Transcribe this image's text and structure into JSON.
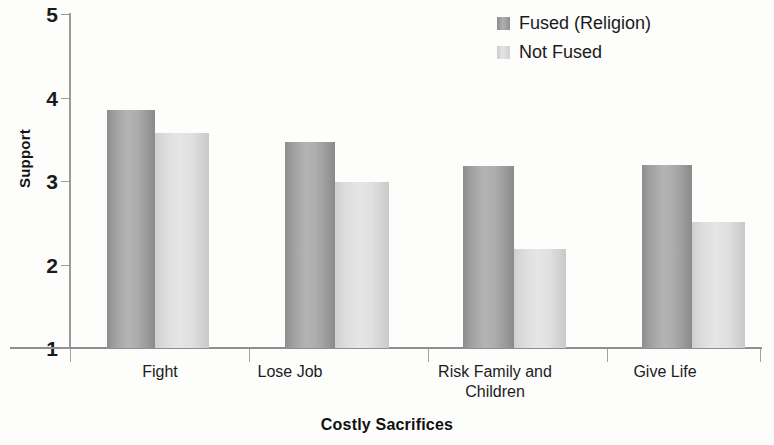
{
  "chart_data": {
    "type": "bar",
    "title": "",
    "xlabel": "Costly Sacrifices",
    "ylabel": "Support",
    "categories": [
      "Fight",
      "Lose Job",
      "Risk Family and Children",
      "Give Life"
    ],
    "series": [
      {
        "name": "Fused (Religion)",
        "values": [
          3.85,
          3.47,
          3.18,
          3.19
        ],
        "color": "#a8a8a8"
      },
      {
        "name": "Not Fused",
        "values": [
          3.58,
          2.99,
          2.18,
          2.51
        ],
        "color": "#dcdcdc"
      }
    ],
    "ylim": [
      1,
      5
    ],
    "yticks": [
      1,
      2,
      3,
      4,
      5
    ],
    "grid": false,
    "legend_position": "top-right"
  },
  "axes": {
    "y_tick_labels": [
      "5",
      "4",
      "3",
      "2",
      "1"
    ],
    "y_title": "Support",
    "x_title": "Costly Sacrifices",
    "x_tick_labels": [
      {
        "line1": "Fight",
        "line2": ""
      },
      {
        "line1": "Lose Job",
        "line2": ""
      },
      {
        "line1": "Risk Family and",
        "line2": "Children"
      },
      {
        "line1": "Give Life",
        "line2": ""
      }
    ]
  },
  "legend": {
    "items": [
      {
        "label": "Fused (Religion)",
        "swatch": "dark-gray-swatch"
      },
      {
        "label": "Not Fused",
        "swatch": "light-gray-swatch"
      }
    ]
  }
}
